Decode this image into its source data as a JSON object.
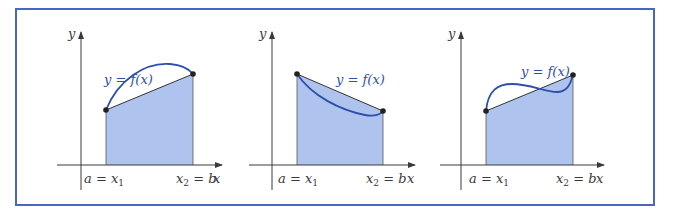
{
  "colors": {
    "frame": "#4a66c4",
    "fill": "#aec4ee",
    "curve": "#2d4fa8",
    "axis": "#3a3a3a",
    "chord": "#333333",
    "label_curve": "#2d4fa8"
  },
  "frame": {
    "x": 16,
    "y": 9,
    "width": 638,
    "height": 196
  },
  "panels": [
    {
      "id": "concave",
      "y_axis_label": "y",
      "x_axis_label": "x",
      "curve_label": "y = f(x)",
      "left_label": {
        "lhs": "a",
        "rhs": "x",
        "sub": "1"
      },
      "right_label": {
        "lhs": "x",
        "sub": "2",
        "rhs": "b"
      },
      "axis": {
        "ox": 81,
        "oy": 165,
        "xmin": 57,
        "xmax": 222,
        "ytop": 32,
        "ybottom": 190
      },
      "p1": [
        106,
        110
      ],
      "p2": [
        193,
        74
      ],
      "curve_path": "M106,110 C118,80 145,62 170,64 C182,65 189,69 193,74",
      "curve_label_pos": [
        104,
        84
      ],
      "left_label_pos": [
        84,
        183
      ],
      "right_label_pos": [
        176,
        183
      ],
      "x_label_pos": [
        213,
        183
      ],
      "y_label_pos": [
        68,
        38
      ]
    },
    {
      "id": "convex",
      "y_axis_label": "y",
      "x_axis_label": "x",
      "curve_label": "y = f(x)",
      "left_label": {
        "lhs": "a",
        "rhs": "x",
        "sub": "1"
      },
      "right_label": {
        "lhs": "x",
        "sub": "2",
        "rhs": "b"
      },
      "axis": {
        "ox": 272,
        "oy": 165,
        "xmin": 249,
        "xmax": 415,
        "ytop": 32,
        "ybottom": 190
      },
      "p1": [
        297,
        74
      ],
      "p2": [
        383,
        111
      ],
      "curve_path": "M297,74 C312,96 340,110 365,115 C375,117 381,114 383,111",
      "curve_label_pos": [
        336,
        84
      ],
      "left_label_pos": [
        278,
        183
      ],
      "right_label_pos": [
        366,
        183
      ],
      "x_label_pos": [
        407,
        183
      ],
      "y_label_pos": [
        259,
        38
      ]
    },
    {
      "id": "inflection",
      "y_axis_label": "y",
      "x_axis_label": "x",
      "curve_label": "y = f(x)",
      "left_label": {
        "lhs": "a",
        "rhs": "x",
        "sub": "1"
      },
      "right_label": {
        "lhs": "x",
        "sub": "2",
        "rhs": "b"
      },
      "axis": {
        "ox": 461,
        "oy": 165,
        "xmin": 440,
        "xmax": 604,
        "ytop": 32,
        "ybottom": 190
      },
      "p1": [
        486,
        111
      ],
      "p2": [
        573,
        75
      ],
      "curve_path": "M486,111 C488,90 498,84 512,84 C530,84 545,92 557,92 C566,92 570,86 573,75",
      "curve_label_pos": [
        521,
        76
      ],
      "left_label_pos": [
        469,
        183
      ],
      "right_label_pos": [
        556,
        183
      ],
      "x_label_pos": [
        596,
        183
      ],
      "y_label_pos": [
        448,
        38
      ]
    }
  ]
}
